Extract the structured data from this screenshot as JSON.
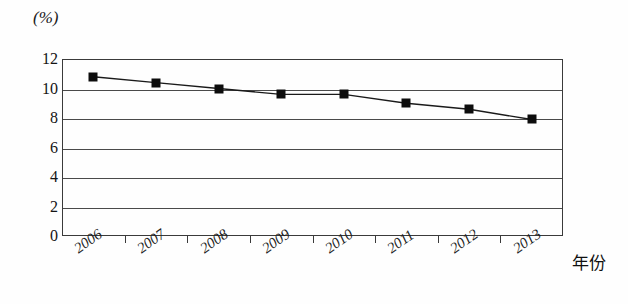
{
  "figure": {
    "unit_label": "(%)",
    "x_axis_title": "年份"
  },
  "chart_data": {
    "type": "line",
    "title": "",
    "subtitle": "",
    "xlabel": "年份",
    "ylabel": "(%)",
    "categories": [
      "2006",
      "2007",
      "2008",
      "2009",
      "2010",
      "2011",
      "2012",
      "2013"
    ],
    "values": [
      10.8,
      10.4,
      10.0,
      9.6,
      9.6,
      9.0,
      8.6,
      7.9
    ],
    "series": [
      {
        "name": "",
        "values": [
          10.8,
          10.4,
          10.0,
          9.6,
          9.6,
          9.0,
          8.6,
          7.9
        ]
      }
    ],
    "ylim": [
      0,
      12
    ],
    "y_ticks": [
      "0",
      "2",
      "4",
      "6",
      "8",
      "10",
      "12"
    ],
    "y_tick_values": [
      0,
      2,
      4,
      6,
      8,
      10,
      12
    ],
    "grid": true,
    "grid_orientation": "horizontal",
    "legend": "none",
    "marker": "square",
    "marker_color": "#0d0d0d",
    "line_color": "#1a1a1a"
  }
}
